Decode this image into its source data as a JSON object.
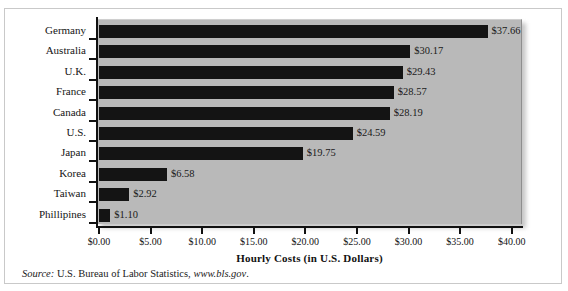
{
  "chart_data": {
    "type": "bar",
    "orientation": "horizontal",
    "title": "",
    "xlabel": "Hourly Costs (in U.S. Dollars)",
    "ylabel": "Countries",
    "categories": [
      "Germany",
      "Australia",
      "U.K.",
      "France",
      "Canada",
      "U.S.",
      "Japan",
      "Korea",
      "Taiwan",
      "Phillipines"
    ],
    "values": [
      37.66,
      30.17,
      29.43,
      28.57,
      28.19,
      24.59,
      19.75,
      6.58,
      2.92,
      1.1
    ],
    "value_labels": [
      "$37.66",
      "$30.17",
      "$29.43",
      "$28.57",
      "$28.19",
      "$24.59",
      "$19.75",
      "$6.58",
      "$2.92",
      "$1.10"
    ],
    "xlim": [
      0,
      40
    ],
    "xticks": [
      0,
      5,
      10,
      15,
      20,
      25,
      30,
      35,
      40
    ],
    "xtick_labels": [
      "$0.00",
      "$5.00",
      "$10.00",
      "$15.00",
      "$20.00",
      "$25.00",
      "$30.00",
      "$35.00",
      "$40.00"
    ],
    "grid": false,
    "legend": false,
    "bar_color": "#141414",
    "plot_background": "#b9b9b9",
    "figure_background": "#ffffff"
  },
  "source": {
    "keyword": "Source:",
    "text": " U.S. Bureau of Labor Statistics, ",
    "url": "www.bls.gov",
    "period": "."
  }
}
